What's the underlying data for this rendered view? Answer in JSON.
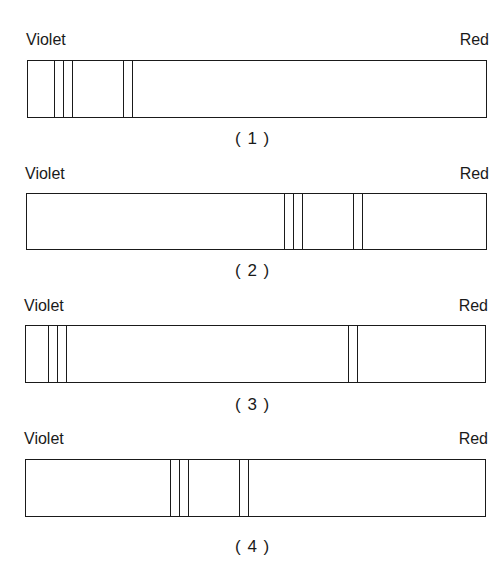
{
  "labels": {
    "left": "Violet",
    "right": "Red"
  },
  "spectra": [
    {
      "caption": "( 1 )",
      "lines_px": [
        54,
        63,
        72,
        123,
        132
      ]
    },
    {
      "caption": "( 2 )",
      "lines_px": [
        284,
        293,
        302,
        353,
        362
      ]
    },
    {
      "caption": "( 3 )",
      "lines_px": [
        48,
        57,
        66,
        348,
        357
      ]
    },
    {
      "caption": "( 4 )",
      "lines_px": [
        170,
        179,
        188,
        239,
        248
      ]
    }
  ]
}
